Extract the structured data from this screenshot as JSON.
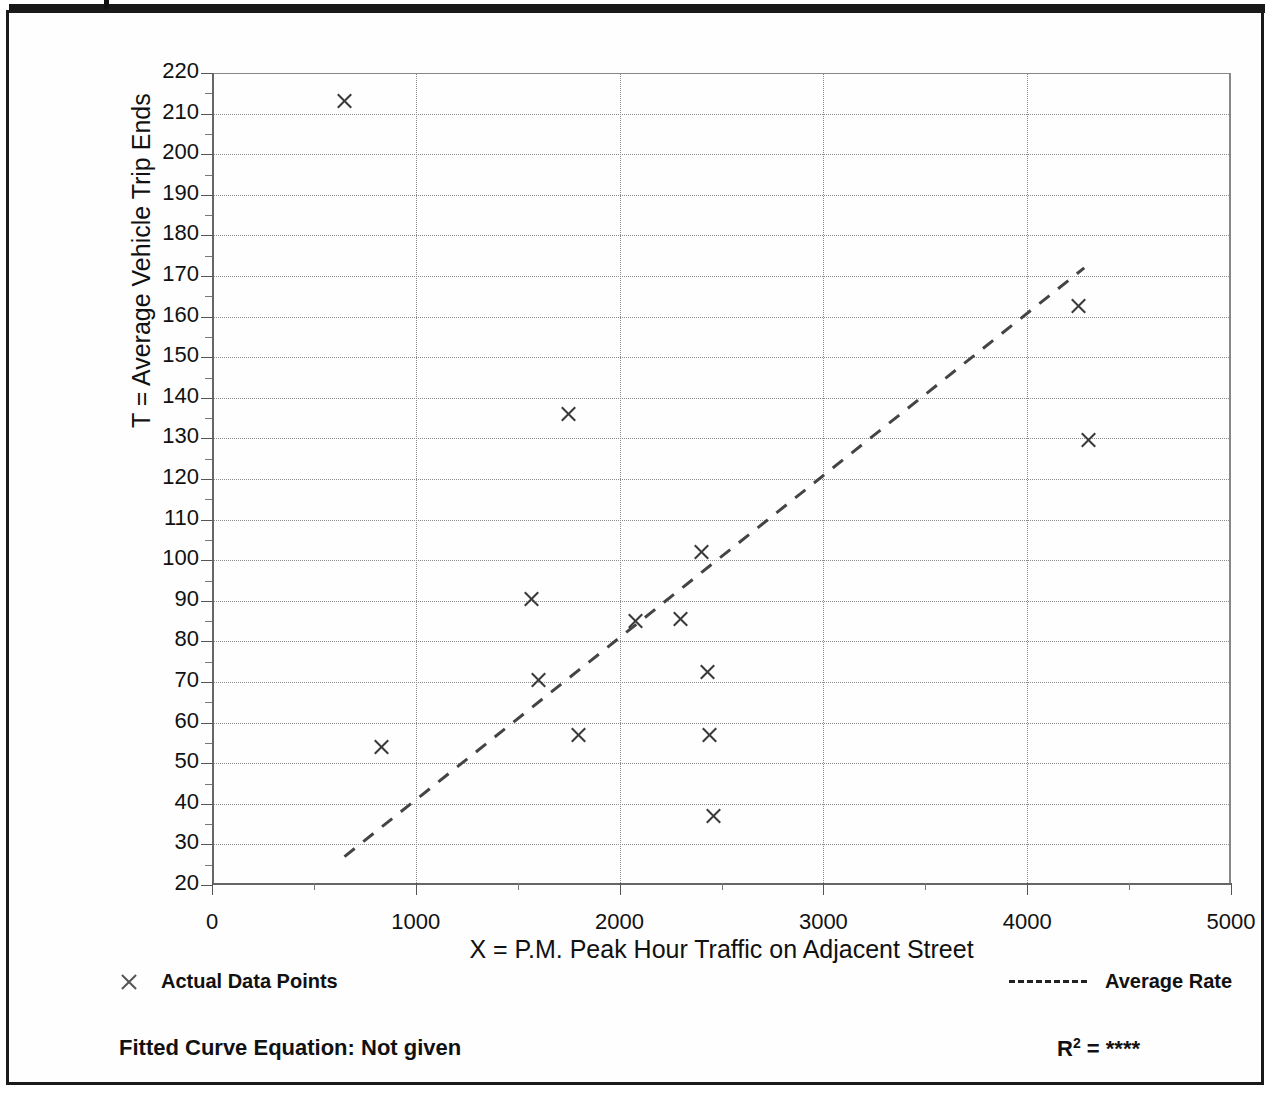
{
  "chart_data": {
    "type": "scatter",
    "title": "",
    "xlabel": "X = P.M. Peak Hour Traffic on Adjacent Street",
    "ylabel": "T = Average Vehicle Trip Ends",
    "xlim": [
      0,
      5000
    ],
    "ylim": [
      20,
      220
    ],
    "grid": true,
    "x_ticks": [
      0,
      1000,
      2000,
      3000,
      4000,
      5000
    ],
    "x_tick_labels": [
      "0",
      "1000",
      "2000",
      "3000",
      "4000",
      "5000"
    ],
    "x_minor_step": 500,
    "y_ticks": [
      20,
      30,
      40,
      50,
      60,
      70,
      80,
      90,
      100,
      110,
      120,
      130,
      140,
      150,
      160,
      170,
      180,
      190,
      200,
      210,
      220
    ],
    "y_tick_labels": [
      "20",
      "30",
      "40",
      "50",
      "60",
      "70",
      "80",
      "90",
      "100",
      "110",
      "120",
      "130",
      "140",
      "150",
      "160",
      "170",
      "180",
      "190",
      "200",
      "210",
      "220"
    ],
    "y_minor_step": 5,
    "series": [
      {
        "name": "Actual Data Points",
        "marker": "x",
        "points": [
          {
            "x": 650,
            "y": 213
          },
          {
            "x": 830,
            "y": 54
          },
          {
            "x": 1570,
            "y": 90.5
          },
          {
            "x": 1600,
            "y": 70.5
          },
          {
            "x": 1750,
            "y": 136
          },
          {
            "x": 1800,
            "y": 57
          },
          {
            "x": 2080,
            "y": 85
          },
          {
            "x": 2300,
            "y": 85.5
          },
          {
            "x": 2400,
            "y": 102
          },
          {
            "x": 2430,
            "y": 72.5
          },
          {
            "x": 2440,
            "y": 57
          },
          {
            "x": 2460,
            "y": 37
          },
          {
            "x": 4250,
            "y": 162.5
          },
          {
            "x": 4300,
            "y": 129.5
          }
        ]
      },
      {
        "name": "Average Rate",
        "type": "line",
        "style": "dashed",
        "endpoints": [
          {
            "x": 650,
            "y": 27
          },
          {
            "x": 4280,
            "y": 172
          }
        ]
      }
    ],
    "legend": {
      "position": "below-axes",
      "entries": [
        {
          "label": "Actual Data Points",
          "marker": "x"
        },
        {
          "label": "Average Rate",
          "marker": "dashed-line"
        }
      ]
    },
    "annotations": {
      "fitted_curve_equation": "Fitted Curve Equation:  Not given",
      "r_squared_label": "R",
      "r_squared_exponent": "2",
      "r_squared_value": "= ****"
    },
    "colors": {
      "marker": "#3a3a3a",
      "gridline": "#8a8a8a",
      "axis": "#555555",
      "trendline": "#444444",
      "frame": "#1a1a1a",
      "background": "#ffffff"
    }
  }
}
